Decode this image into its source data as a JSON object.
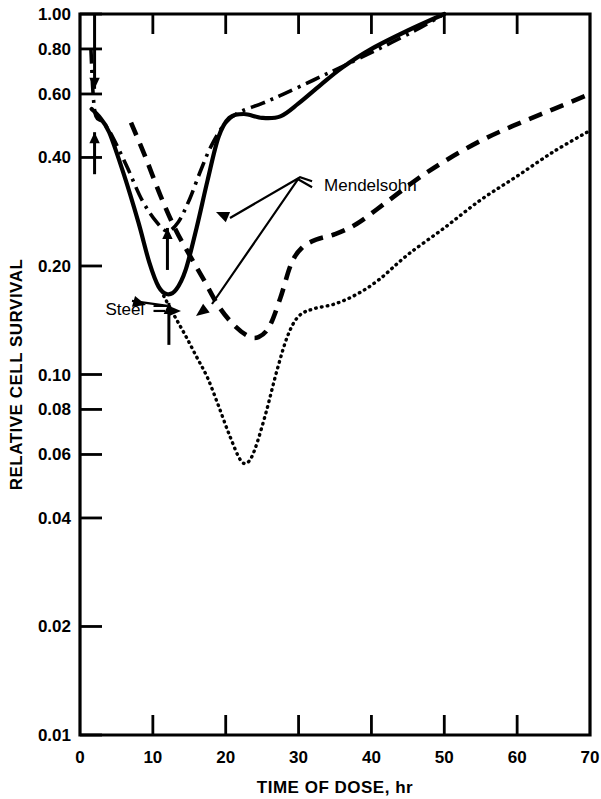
{
  "chart_data": {
    "type": "line",
    "title": "",
    "xlabel": "TIME OF DOSE, hr",
    "ylabel": "RELATIVE CELL SURVIVAL",
    "xlim": [
      0,
      70
    ],
    "ylim": [
      0.01,
      1.0
    ],
    "yscale": "log",
    "grid": false,
    "legend_position": "inline-annotations",
    "xticks": [
      0,
      10,
      20,
      30,
      40,
      50,
      60,
      70
    ],
    "xtick_labels": [
      "0",
      "10",
      "20",
      "30",
      "40",
      "50",
      "60",
      "70"
    ],
    "yticks": [
      1.0,
      0.8,
      0.6,
      0.4,
      0.2,
      0.1,
      0.08,
      0.06,
      0.04,
      0.02,
      0.01
    ],
    "ytick_labels": [
      "1.00",
      "0.80",
      "0.60",
      "0.40",
      "0.20",
      "0.10",
      "0.08",
      "0.06",
      "0.04",
      "0.02",
      "0.01"
    ],
    "annotations": [
      {
        "text": "Mendelsohn",
        "x": 33.5,
        "y": 0.335,
        "points_to": [
          "dash-dot-curve",
          "dashed-curve"
        ]
      },
      {
        "text": "Steel",
        "x": 3.5,
        "y": 0.152,
        "points_to": [
          "solid-curve",
          "dotted-curve"
        ]
      }
    ],
    "arrow_markers": [
      {
        "type": "down-arrow",
        "x": 2.0,
        "y_top": 1.0,
        "y_tip": 0.62,
        "note": "dose arrow at top"
      },
      {
        "type": "up-arrow",
        "x": 2.0,
        "y_tip": 0.47,
        "note": "dose arrow near 0.45"
      },
      {
        "type": "up-arrow",
        "x": 12.0,
        "y_tip": 0.255,
        "note": "dose arrow mid"
      },
      {
        "type": "up-arrow",
        "x": 12.2,
        "y_tip": 0.158,
        "note": "dose arrow lower"
      }
    ],
    "series": [
      {
        "name": "Steel solid",
        "style": "solid",
        "points": [
          [
            1.6,
            0.545
          ],
          [
            2.6,
            0.52
          ],
          [
            4.0,
            0.47
          ],
          [
            6.0,
            0.36
          ],
          [
            8.0,
            0.265
          ],
          [
            9.5,
            0.205
          ],
          [
            10.8,
            0.175
          ],
          [
            12.0,
            0.167
          ],
          [
            13.2,
            0.172
          ],
          [
            14.5,
            0.195
          ],
          [
            16.0,
            0.255
          ],
          [
            17.5,
            0.345
          ],
          [
            19.0,
            0.455
          ],
          [
            20.5,
            0.515
          ],
          [
            22.5,
            0.528
          ],
          [
            25.0,
            0.515
          ],
          [
            27.5,
            0.52
          ],
          [
            30.0,
            0.565
          ],
          [
            33.0,
            0.635
          ],
          [
            36.0,
            0.71
          ],
          [
            40.0,
            0.8
          ],
          [
            45.0,
            0.9
          ],
          [
            50.0,
            1.0
          ]
        ]
      },
      {
        "name": "Mendelsohn dash-dot",
        "style": "dash-dot",
        "points": [
          [
            1.5,
            0.8
          ],
          [
            1.8,
            0.6
          ],
          [
            2.2,
            0.52
          ],
          [
            3.2,
            0.5
          ],
          [
            4.5,
            0.455
          ],
          [
            6.5,
            0.375
          ],
          [
            8.5,
            0.305
          ],
          [
            10.5,
            0.265
          ],
          [
            12.0,
            0.25
          ],
          [
            13.5,
            0.265
          ],
          [
            15.0,
            0.305
          ],
          [
            16.5,
            0.365
          ],
          [
            18.0,
            0.43
          ],
          [
            20.0,
            0.5
          ],
          [
            22.0,
            0.535
          ],
          [
            25.0,
            0.565
          ],
          [
            28.0,
            0.6
          ],
          [
            32.0,
            0.655
          ],
          [
            36.0,
            0.715
          ],
          [
            41.0,
            0.8
          ],
          [
            46.0,
            0.9
          ],
          [
            50.0,
            1.0
          ]
        ]
      },
      {
        "name": "Mendelsohn dashed",
        "style": "dashed",
        "points": [
          [
            7.0,
            0.5
          ],
          [
            9.0,
            0.4
          ],
          [
            11.0,
            0.315
          ],
          [
            13.0,
            0.255
          ],
          [
            15.0,
            0.215
          ],
          [
            17.0,
            0.183
          ],
          [
            19.0,
            0.155
          ],
          [
            21.0,
            0.138
          ],
          [
            23.0,
            0.128
          ],
          [
            24.5,
            0.127
          ],
          [
            26.0,
            0.136
          ],
          [
            27.5,
            0.163
          ],
          [
            29.0,
            0.203
          ],
          [
            30.5,
            0.225
          ],
          [
            32.5,
            0.237
          ],
          [
            35.0,
            0.245
          ],
          [
            38.0,
            0.262
          ],
          [
            42.0,
            0.3
          ],
          [
            46.0,
            0.345
          ],
          [
            50.0,
            0.39
          ],
          [
            55.0,
            0.445
          ],
          [
            60.0,
            0.495
          ],
          [
            65.0,
            0.545
          ],
          [
            70.0,
            0.6
          ]
        ]
      },
      {
        "name": "Steel dotted",
        "style": "dotted",
        "points": [
          [
            11.5,
            0.165
          ],
          [
            13.0,
            0.145
          ],
          [
            14.5,
            0.128
          ],
          [
            16.0,
            0.112
          ],
          [
            17.5,
            0.098
          ],
          [
            19.0,
            0.082
          ],
          [
            20.5,
            0.068
          ],
          [
            22.0,
            0.058
          ],
          [
            23.0,
            0.057
          ],
          [
            24.0,
            0.062
          ],
          [
            25.5,
            0.078
          ],
          [
            27.0,
            0.102
          ],
          [
            28.5,
            0.128
          ],
          [
            30.0,
            0.145
          ],
          [
            32.0,
            0.152
          ],
          [
            35.0,
            0.157
          ],
          [
            38.0,
            0.167
          ],
          [
            41.0,
            0.183
          ],
          [
            45.0,
            0.215
          ],
          [
            50.0,
            0.255
          ],
          [
            55.0,
            0.305
          ],
          [
            60.0,
            0.355
          ],
          [
            65.0,
            0.415
          ],
          [
            70.0,
            0.475
          ]
        ]
      }
    ]
  },
  "axis": {
    "y_title": "RELATIVE CELL SURVIVAL",
    "x_title": "TIME OF DOSE, hr"
  },
  "labels": {
    "mendelsohn": "Mendelsohn",
    "steel": "Steel"
  }
}
